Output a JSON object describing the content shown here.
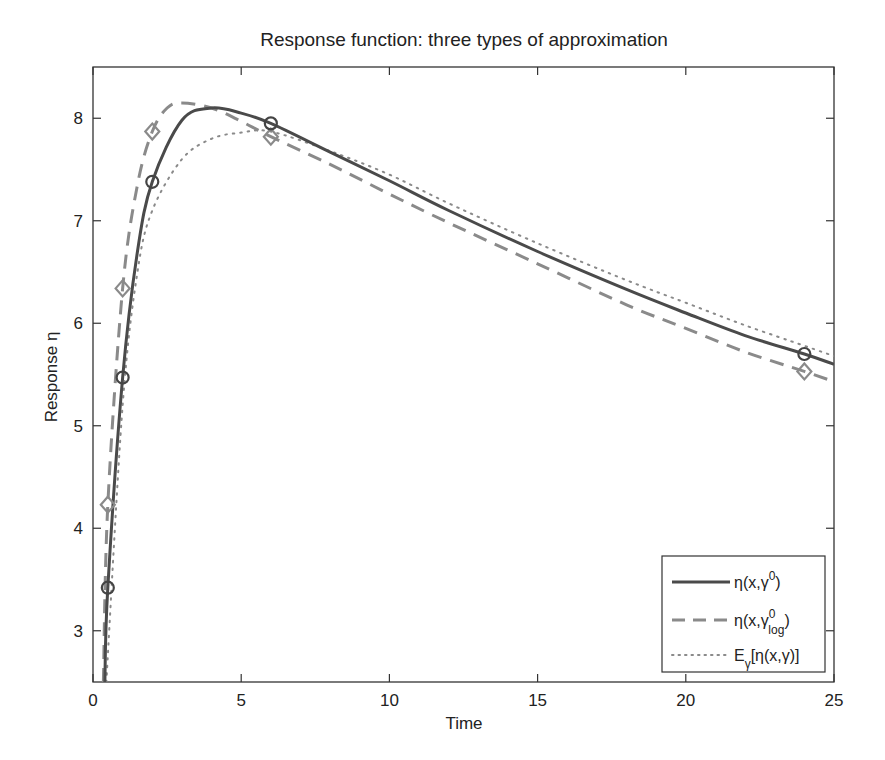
{
  "chart_data": {
    "type": "line",
    "title": "Response function:  three types of approximation",
    "xlabel": "Time",
    "ylabel": "Response  η",
    "xlim": [
      0,
      25
    ],
    "ylim": [
      2.5,
      8.5
    ],
    "xticks": [
      0,
      5,
      10,
      15,
      20,
      25
    ],
    "yticks": [
      3,
      4,
      5,
      6,
      7,
      8
    ],
    "grid": false,
    "legend_position": "lower right",
    "series": [
      {
        "name": "η(x,γ⁰)",
        "style": "solid",
        "color": "#4a4a4a",
        "marker": "circle",
        "x": [
          0.4,
          0.5,
          1,
          1.5,
          2,
          3,
          4,
          5,
          6,
          8,
          10,
          12,
          15,
          18,
          20,
          22,
          24,
          25
        ],
        "y": [
          2.5,
          3.42,
          5.47,
          6.7,
          7.38,
          7.98,
          8.1,
          8.05,
          7.95,
          7.67,
          7.39,
          7.1,
          6.7,
          6.33,
          6.1,
          5.88,
          5.7,
          5.6
        ],
        "marker_points": {
          "x": [
            0.5,
            1,
            2,
            6,
            24
          ],
          "y": [
            3.42,
            5.47,
            7.38,
            7.95,
            5.7
          ]
        }
      },
      {
        "name": "η(x,γ⁰_log)",
        "style": "dashed",
        "color": "#8a8a8a",
        "marker": "diamond",
        "x": [
          0.35,
          0.5,
          1,
          1.5,
          2,
          2.5,
          3,
          4,
          5,
          6,
          8,
          10,
          12,
          15,
          18,
          20,
          22,
          24,
          25
        ],
        "y": [
          2.5,
          4.23,
          6.34,
          7.35,
          7.87,
          8.1,
          8.15,
          8.1,
          7.97,
          7.82,
          7.55,
          7.26,
          6.98,
          6.58,
          6.18,
          5.95,
          5.72,
          5.53,
          5.43
        ],
        "marker_points": {
          "x": [
            0.5,
            1,
            2,
            6,
            24
          ],
          "y": [
            4.23,
            6.34,
            7.87,
            7.82,
            5.53
          ]
        }
      },
      {
        "name": "E_γ[η(x,γ)]",
        "style": "dotted",
        "color": "#8a8a8a",
        "marker": "none",
        "x": [
          0.45,
          1,
          1.5,
          2,
          3,
          4,
          5,
          6,
          8,
          10,
          12,
          15,
          18,
          20,
          22,
          24,
          25
        ],
        "y": [
          2.5,
          5.2,
          6.5,
          7.1,
          7.6,
          7.8,
          7.86,
          7.87,
          7.68,
          7.45,
          7.17,
          6.78,
          6.42,
          6.2,
          5.98,
          5.78,
          5.68
        ]
      }
    ],
    "legend": [
      {
        "main": "η(x,γ",
        "sup": "0",
        "sub": "",
        "tail": ")"
      },
      {
        "main": "η(x,γ",
        "sup": "0",
        "sub": "log",
        "tail": ")"
      },
      {
        "main": "E",
        "sub": "γ",
        "tail": "[η(x,γ)]"
      }
    ]
  }
}
